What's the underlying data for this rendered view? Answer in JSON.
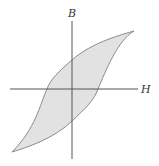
{
  "diagram": {
    "axes": {
      "vertical_label": "B",
      "horizontal_label": "H"
    },
    "colors": {
      "axis": "#555555",
      "loop_stroke": "#8a8a8a",
      "loop_fill": "#e2e2e2",
      "label": "#333333"
    }
  }
}
